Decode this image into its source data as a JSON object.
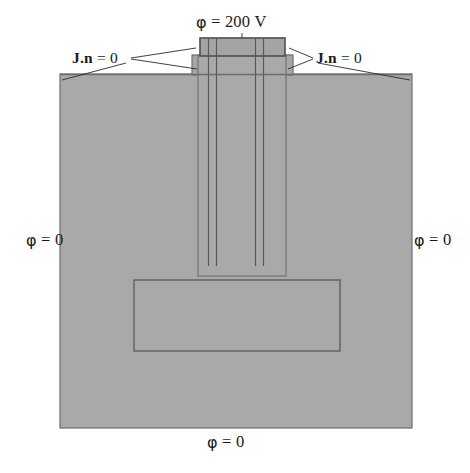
{
  "figure": {
    "type": "boundary-condition-schematic",
    "background_color": "#ffffff",
    "body_fill_color": "#a8a8a8",
    "outline_color": "#6e6e6e",
    "text_color": "#1a1a1a"
  },
  "labels": {
    "top_voltage": {
      "symbol": "φ",
      "rest": " = 200 V",
      "full": "φ = 200 V"
    },
    "left_potential": {
      "symbol": "φ",
      "rest": " = 0",
      "full": "φ = 0"
    },
    "right_potential": {
      "symbol": "φ",
      "rest": " = 0",
      "full": "φ = 0"
    },
    "bottom_potential": {
      "symbol": "φ",
      "rest": " = 0",
      "full": "φ = 0"
    },
    "left_flux": {
      "vector": "J",
      "dot_normal": ".n",
      "rest": " = 0",
      "full": "J.n = 0"
    },
    "right_flux": {
      "vector": "J",
      "dot_normal": ".n",
      "rest": " = 0",
      "full": "J.n = 0"
    }
  },
  "geometry": {
    "substrate": {
      "x": 60,
      "y": 74,
      "width": 352,
      "height": 354
    },
    "pillar_shoulder": {
      "x": 192,
      "y": 55,
      "width": 101,
      "height": 20
    },
    "pillar_column": {
      "x": 198,
      "y": 55,
      "width": 88,
      "height": 220
    },
    "top_electrode": {
      "x": 200,
      "y": 38,
      "width": 85,
      "height": 18
    },
    "buried_rectangle": {
      "x": 134,
      "y": 280,
      "width": 206,
      "height": 71
    },
    "inner_lines_x": [
      208,
      216,
      255,
      263
    ],
    "inner_lines_y_start": 55,
    "inner_lines_y_end": 266
  }
}
